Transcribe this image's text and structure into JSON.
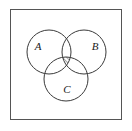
{
  "figure": {
    "kind": "venn-diagram",
    "background_color": "#ffffff",
    "frame": {
      "name": "outer-frame",
      "x": 10,
      "y": 9,
      "width": 112,
      "height": 111,
      "stroke_color": "#555555",
      "stroke_width": 1,
      "fill_color": "#ffffff"
    },
    "sets": [
      {
        "id": "A",
        "label": "A",
        "cx": 49,
        "cy": 52,
        "r": 22,
        "label_x": 38,
        "label_y": 47,
        "stroke_color": "#3a3a3a",
        "stroke_width": 1,
        "fill_color": "none"
      },
      {
        "id": "B",
        "label": "B",
        "cx": 84,
        "cy": 52,
        "r": 22,
        "label_x": 95,
        "label_y": 47,
        "stroke_color": "#3a3a3a",
        "stroke_width": 1,
        "fill_color": "none"
      },
      {
        "id": "C",
        "label": "C",
        "cx": 66,
        "cy": 79,
        "r": 22,
        "label_x": 67,
        "label_y": 90,
        "stroke_color": "#3a3a3a",
        "stroke_width": 1,
        "fill_color": "none"
      }
    ],
    "shaded_region": {
      "name": "triple-intersection",
      "expression": "A ∩ B ∩ C",
      "fill_pattern": "diagonal-hatch",
      "hatch_direction": "lower-left-to-upper-right",
      "hatch_spacing": 3,
      "hatch_color": "#2b2b2b",
      "hatch_stroke_width": 0.8,
      "outline_color": "#2b2b2b"
    }
  }
}
